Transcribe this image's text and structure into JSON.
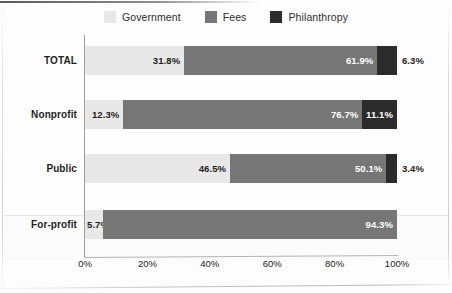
{
  "legend": {
    "items": [
      {
        "label": "Government",
        "color": "#e8e8e8",
        "key": "government"
      },
      {
        "label": "Fees",
        "color": "#767676",
        "key": "fees"
      },
      {
        "label": "Philanthropy",
        "color": "#2b2b2b",
        "key": "philanthropy"
      }
    ]
  },
  "chart_data": {
    "type": "bar",
    "orientation": "horizontal",
    "stacked": true,
    "normalized": "100%",
    "title": "",
    "subtitle": "",
    "xlabel": "",
    "ylabel": "",
    "xlim": [
      0,
      100
    ],
    "grid": false,
    "legend_position": "top-center",
    "categories": [
      "TOTAL",
      "Nonprofit",
      "Public",
      "For-profit"
    ],
    "xticks": [
      "0%",
      "20%",
      "40%",
      "60%",
      "80%",
      "100%"
    ],
    "xtick_values": [
      0,
      20,
      40,
      60,
      80,
      100
    ],
    "series": [
      {
        "name": "Government",
        "color": "#e8e8e8",
        "values": [
          31.8,
          12.3,
          46.5,
          5.7
        ]
      },
      {
        "name": "Fees",
        "color": "#767676",
        "values": [
          61.9,
          76.7,
          50.1,
          94.3
        ]
      },
      {
        "name": "Philanthropy",
        "color": "#2b2b2b",
        "values": [
          6.3,
          11.1,
          3.4,
          0
        ]
      }
    ],
    "rows": [
      {
        "category": "TOTAL",
        "segments": [
          {
            "series": "Government",
            "value": 31.8,
            "label": "31.8%",
            "label_color": "dark",
            "label_outside": false
          },
          {
            "series": "Fees",
            "value": 61.9,
            "label": "61.9%",
            "label_color": "light",
            "label_outside": false
          },
          {
            "series": "Philanthropy",
            "value": 6.3,
            "label": "6.3%",
            "label_color": "dark",
            "label_outside": true
          }
        ]
      },
      {
        "category": "Nonprofit",
        "segments": [
          {
            "series": "Government",
            "value": 12.3,
            "label": "12.3%",
            "label_color": "dark",
            "label_outside": false
          },
          {
            "series": "Fees",
            "value": 76.7,
            "label": "76.7%",
            "label_color": "light",
            "label_outside": false
          },
          {
            "series": "Philanthropy",
            "value": 11.1,
            "label": "11.1%",
            "label_color": "light",
            "label_outside": false
          }
        ]
      },
      {
        "category": "Public",
        "segments": [
          {
            "series": "Government",
            "value": 46.5,
            "label": "46.5%",
            "label_color": "dark",
            "label_outside": false
          },
          {
            "series": "Fees",
            "value": 50.1,
            "label": "50.1%",
            "label_color": "light",
            "label_outside": false
          },
          {
            "series": "Philanthropy",
            "value": 3.4,
            "label": "3.4%",
            "label_color": "dark",
            "label_outside": true
          }
        ]
      },
      {
        "category": "For-profit",
        "segments": [
          {
            "series": "Government",
            "value": 5.7,
            "label": "5.7%",
            "label_color": "dark",
            "label_outside": "left"
          },
          {
            "series": "Fees",
            "value": 94.3,
            "label": "94.3%",
            "label_color": "light",
            "label_outside": false
          },
          {
            "series": "Philanthropy",
            "value": 0,
            "label": "",
            "label_color": "dark",
            "label_outside": false
          }
        ]
      }
    ]
  }
}
